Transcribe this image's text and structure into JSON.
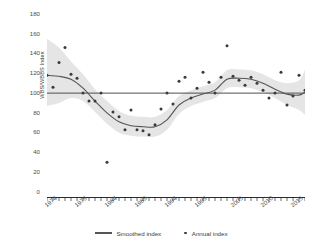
{
  "chart_data": {
    "type": "line",
    "title": "",
    "xlabel": "",
    "ylabel": "WBS/WBBS Index",
    "ylim": [
      0,
      180
    ],
    "xlim": [
      1974,
      2017
    ],
    "yticks": [
      0,
      20,
      40,
      60,
      80,
      100,
      120,
      140,
      160,
      180
    ],
    "xticks": [
      1974,
      1979,
      1984,
      1989,
      1994,
      1999,
      2005,
      2010,
      2015
    ],
    "grid": false,
    "legend_position": "bottom",
    "reference_line": {
      "value": 100,
      "label": ""
    },
    "series": [
      {
        "name": "Annual index",
        "type": "scatter",
        "x": [
          1974,
          1975,
          1976,
          1977,
          1978,
          1979,
          1980,
          1981,
          1982,
          1983,
          1984,
          1985,
          1986,
          1987,
          1988,
          1989,
          1990,
          1991,
          1992,
          1993,
          1994,
          1995,
          1996,
          1997,
          1998,
          1999,
          2000,
          2001,
          2002,
          2003,
          2004,
          2005,
          2006,
          2007,
          2008,
          2009,
          2010,
          2011,
          2012,
          2013,
          2014,
          2015,
          2016,
          2017
        ],
        "values": [
          118,
          106,
          131,
          146,
          119,
          115,
          100,
          92,
          92,
          100,
          30,
          81,
          76,
          63,
          83,
          63,
          62,
          58,
          68,
          84,
          100,
          89,
          112,
          116,
          95,
          105,
          121,
          111,
          100,
          116,
          148,
          117,
          113,
          108,
          116,
          110,
          103,
          95,
          100,
          121,
          88,
          97,
          118,
          103
        ]
      },
      {
        "name": "Smoothed index",
        "type": "line",
        "x": [
          1974,
          1976,
          1978,
          1980,
          1982,
          1984,
          1986,
          1988,
          1990,
          1992,
          1994,
          1996,
          1998,
          2000,
          2002,
          2004,
          2006,
          2008,
          2010,
          2012,
          2014,
          2016,
          2017
        ],
        "values": [
          118,
          117,
          114,
          105,
          92,
          80,
          71,
          67,
          66,
          66,
          73,
          88,
          95,
          99,
          103,
          114,
          115,
          114,
          110,
          104,
          99,
          98,
          101
        ]
      }
    ],
    "confidence_band": {
      "name": "Smoothed index confidence interval",
      "fill": "#e2e2e2",
      "x": [
        1974,
        1976,
        1978,
        1980,
        1982,
        1984,
        1986,
        1988,
        1990,
        1992,
        1994,
        1996,
        1998,
        2000,
        2002,
        2004,
        2006,
        2008,
        2010,
        2012,
        2014,
        2016,
        2017
      ],
      "upper": [
        155,
        146,
        132,
        119,
        104,
        92,
        82,
        77,
        76,
        76,
        83,
        97,
        103,
        107,
        111,
        123,
        124,
        123,
        119,
        113,
        110,
        113,
        124
      ],
      "lower": [
        87,
        90,
        95,
        92,
        81,
        69,
        60,
        57,
        56,
        56,
        63,
        79,
        87,
        91,
        95,
        105,
        106,
        105,
        101,
        95,
        88,
        83,
        78
      ]
    },
    "colors": {
      "line": "#555555",
      "dot": "#3a3a3a",
      "band": "#e2e2e2",
      "reference_line": "#4d4d4d",
      "axis": "#2b2b2b",
      "tick_text": "#4a4a4a"
    }
  },
  "legend": {
    "items": [
      {
        "label": "Smoothed index",
        "marker": "line-marker"
      },
      {
        "label": "Annual index",
        "marker": "dot-marker"
      }
    ]
  },
  "axis_labels": {
    "y_title": "WBS/WBBS Index",
    "y": [
      "180",
      "160",
      "140",
      "120",
      "100",
      "80",
      "60",
      "40",
      "20",
      "0"
    ],
    "x": [
      "1974",
      "1979",
      "1984",
      "1989",
      "1994",
      "1999",
      "2005",
      "2010",
      "2015"
    ]
  }
}
